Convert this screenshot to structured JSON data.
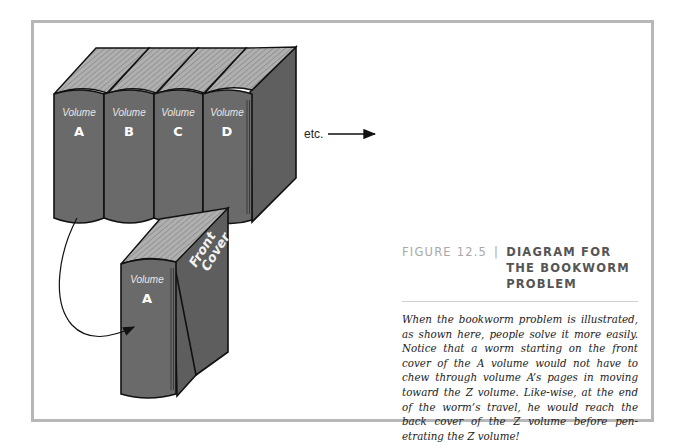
{
  "figure": {
    "label": "FIGURE 12.5",
    "separator": "|",
    "title": "DIAGRAM FOR THE BOOKWORM PROBLEM",
    "body": "When the bookworm problem is illustrated, as shown here, people solve it more easily. Notice that a worm starting on the front cover of the A volume would not have to chew through volume A’s pages in moving toward the Z volume. Like-wise, at the end of the worm’s travel, he would reach the back cover of the Z volume before pen-etrating the Z volume!"
  },
  "diagram": {
    "shelf_books": [
      {
        "volume_word": "Volume",
        "letter": "A"
      },
      {
        "volume_word": "Volume",
        "letter": "B"
      },
      {
        "volume_word": "Volume",
        "letter": "C"
      },
      {
        "volume_word": "Volume",
        "letter": "D"
      }
    ],
    "etc_label": "etc.",
    "detached_book": {
      "volume_word": "Volume",
      "letter": "A",
      "cover_line1": "Front",
      "cover_line2": "Cover"
    },
    "colors": {
      "spine": "#6a6a6a",
      "pages": "#a9a9a9",
      "cover_side": "#5e5e5e",
      "outline": "#111111",
      "frame": "#b7b7b7"
    }
  }
}
